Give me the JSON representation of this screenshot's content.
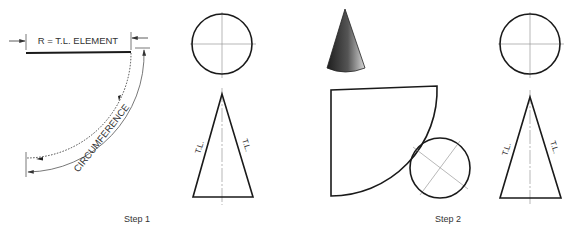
{
  "step1": {
    "caption": "Step 1",
    "radius_label": "R = T.L. ELEMENT",
    "arc_label": "CIRCUMFERENCE",
    "triangle_left_label": "T.L.",
    "triangle_right_label": "T.L."
  },
  "step2": {
    "caption": "Step 2",
    "triangle_left_label": "T.L.",
    "triangle_right_label": "T.L."
  },
  "colors": {
    "line": "#1a1a1a",
    "center_line": "#9a9a9a",
    "cone_dark": "#222222",
    "cone_light": "#cfcfcf"
  }
}
